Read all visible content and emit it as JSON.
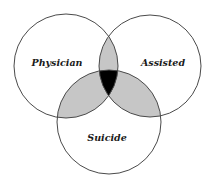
{
  "diagram": {
    "type": "venn",
    "sets": [
      {
        "id": "physician",
        "label": "Physician",
        "cx": 66,
        "cy": 66,
        "r": 52
      },
      {
        "id": "assisted",
        "label": "Assisted",
        "cx": 150,
        "cy": 66,
        "r": 51
      },
      {
        "id": "suicide",
        "label": "Suicide",
        "cx": 109,
        "cy": 122,
        "r": 52
      }
    ],
    "regions": {
      "pairwise_overlap_fill": "#c6c6c6",
      "triple_overlap_fill": "#000000",
      "outer_fill": "#ffffff"
    },
    "stroke_color": "#4a4a4a"
  }
}
